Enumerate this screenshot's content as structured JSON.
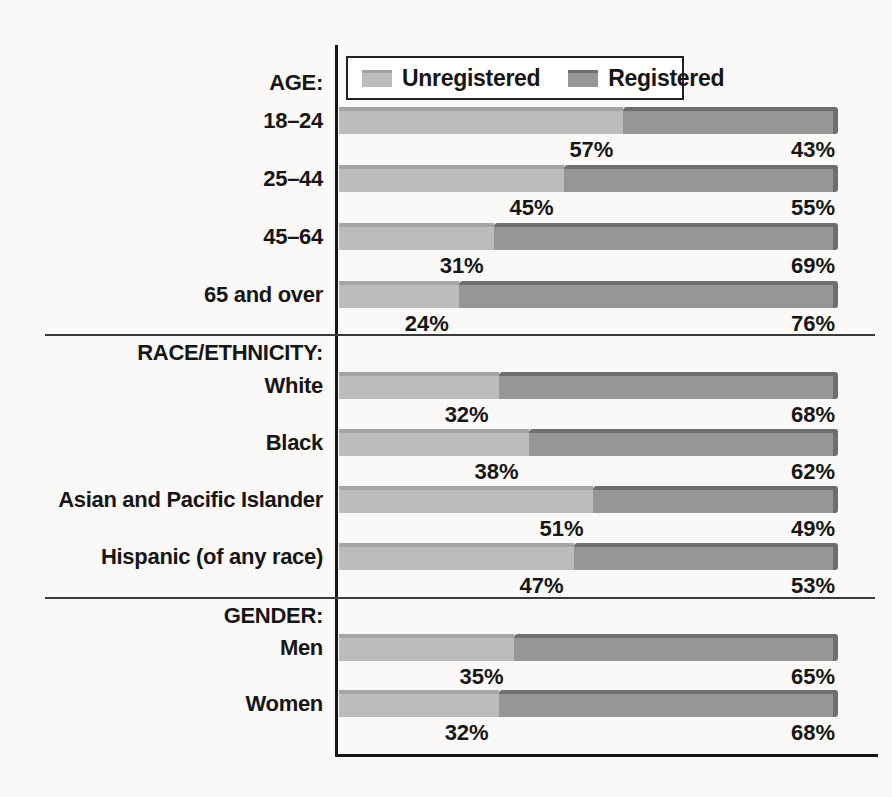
{
  "legend": {
    "unregistered": "Unregistered",
    "registered": "Registered"
  },
  "colors": {
    "paper": "#faf9f7",
    "axis": "#161616",
    "divider": "#3b3b3b",
    "unregistered_fill": "#bcbcbc",
    "unregistered_edge": "#a5a5a5",
    "registered_fill": "#969696",
    "registered_edge": "#6e6e6e",
    "text": "#161616"
  },
  "sections": [
    {
      "header": "AGE:",
      "rows": [
        {
          "label": "18–24",
          "unregistered": 57,
          "registered": 43,
          "unregistered_label": "57%",
          "registered_label": "43%"
        },
        {
          "label": "25–44",
          "unregistered": 45,
          "registered": 55,
          "unregistered_label": "45%",
          "registered_label": "55%"
        },
        {
          "label": "45–64",
          "unregistered": 31,
          "registered": 69,
          "unregistered_label": "31%",
          "registered_label": "69%"
        },
        {
          "label": "65 and over",
          "unregistered": 24,
          "registered": 76,
          "unregistered_label": "24%",
          "registered_label": "76%"
        }
      ]
    },
    {
      "header": "RACE/ETHNICITY:",
      "rows": [
        {
          "label": "White",
          "unregistered": 32,
          "registered": 68,
          "unregistered_label": "32%",
          "registered_label": "68%"
        },
        {
          "label": "Black",
          "unregistered": 38,
          "registered": 62,
          "unregistered_label": "38%",
          "registered_label": "62%"
        },
        {
          "label": "Asian and Pacific Islander",
          "unregistered": 51,
          "registered": 49,
          "unregistered_label": "51%",
          "registered_label": "49%"
        },
        {
          "label": "Hispanic (of any race)",
          "unregistered": 47,
          "registered": 53,
          "unregistered_label": "47%",
          "registered_label": "53%"
        }
      ]
    },
    {
      "header": "GENDER:",
      "rows": [
        {
          "label": "Men",
          "unregistered": 35,
          "registered": 65,
          "unregistered_label": "35%",
          "registered_label": "65%"
        },
        {
          "label": "Women",
          "unregistered": 32,
          "registered": 68,
          "unregistered_label": "32%",
          "registered_label": "68%"
        }
      ]
    }
  ],
  "chart_data": {
    "type": "bar",
    "orientation": "horizontal",
    "stacked": true,
    "unit": "percent",
    "title": "",
    "legend": [
      "Unregistered",
      "Registered"
    ],
    "legend_position": "top",
    "xlim": [
      0,
      100
    ],
    "grid": false,
    "sections": [
      {
        "label": "AGE:",
        "categories": [
          "18–24",
          "25–44",
          "45–64",
          "65 and over"
        ],
        "series": [
          {
            "name": "Unregistered",
            "values": [
              57,
              45,
              31,
              24
            ]
          },
          {
            "name": "Registered",
            "values": [
              43,
              55,
              69,
              76
            ]
          }
        ]
      },
      {
        "label": "RACE/ETHNICITY:",
        "categories": [
          "White",
          "Black",
          "Asian and Pacific Islander",
          "Hispanic (of any race)"
        ],
        "series": [
          {
            "name": "Unregistered",
            "values": [
              32,
              38,
              51,
              47
            ]
          },
          {
            "name": "Registered",
            "values": [
              68,
              62,
              49,
              53
            ]
          }
        ]
      },
      {
        "label": "GENDER:",
        "categories": [
          "Men",
          "Women"
        ],
        "series": [
          {
            "name": "Unregistered",
            "values": [
              35,
              32
            ]
          },
          {
            "name": "Registered",
            "values": [
              65,
              68
            ]
          }
        ]
      }
    ]
  }
}
